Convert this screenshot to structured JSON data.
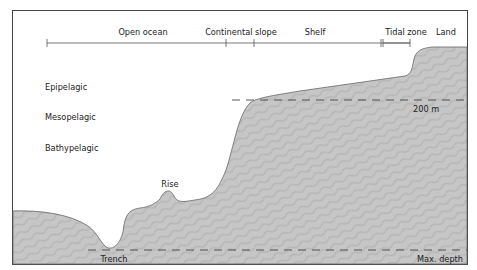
{
  "diagram": {
    "zones_ruler": [
      {
        "label": "Open ocean",
        "x": 143
      },
      {
        "label": "Continental slope",
        "x": 241
      },
      {
        "label": "Shelf",
        "x": 315
      },
      {
        "label": "Tidal zone",
        "x": 407
      },
      {
        "label": "Land",
        "x": 446
      }
    ],
    "depth_layers": [
      {
        "label": "Epipelagic"
      },
      {
        "label": "Mesopelagic"
      },
      {
        "label": "Bathypelagic"
      }
    ],
    "features": {
      "rise": "Rise",
      "trench": "Trench"
    },
    "depth_markers": {
      "shelf_depth": "200 m",
      "max_depth": "Max. depth"
    },
    "colors": {
      "seafloor_fill": "#c4c4c4",
      "outline": "#555555",
      "frame": "#444444",
      "dash": "#444444"
    }
  }
}
